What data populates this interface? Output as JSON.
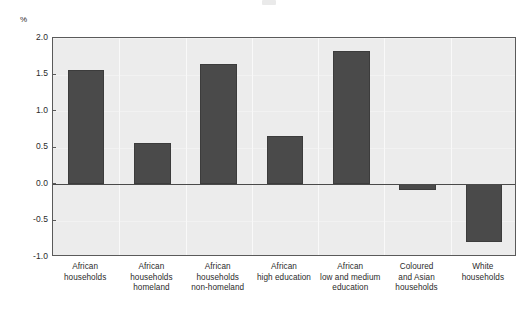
{
  "figure": {
    "unit_label": "%",
    "artifact_note": ""
  },
  "chart_data": {
    "type": "bar",
    "title": "",
    "subtitle": "",
    "xlabel": "",
    "ylabel": "%",
    "ylim": [
      -1.0,
      2.0
    ],
    "yticks": [
      2.0,
      1.5,
      1.0,
      0.5,
      0.0,
      -0.5,
      -1.0
    ],
    "ytick_labels": [
      "2.0",
      "1.5",
      "1.0",
      "0.5",
      "0.0",
      "-0.5",
      "-1.0"
    ],
    "grid": true,
    "legend": false,
    "bar_color": "#4a4a4a",
    "plot_background": "#ececec",
    "categories": [
      "African households",
      "African households homeland",
      "African households non-homeland",
      "African high education",
      "African low and medium education",
      "Coloured and Asian households",
      "White households"
    ],
    "category_lines": [
      [
        "African",
        "households"
      ],
      [
        "African",
        "households",
        "homeland"
      ],
      [
        "African",
        "households",
        "non-homeland"
      ],
      [
        "African",
        "high education"
      ],
      [
        "African",
        "low and medium",
        "education"
      ],
      [
        "Coloured",
        "and Asian",
        "households"
      ],
      [
        "White",
        "households"
      ]
    ],
    "values": [
      1.56,
      0.56,
      1.64,
      0.66,
      1.82,
      -0.08,
      -0.8
    ]
  }
}
